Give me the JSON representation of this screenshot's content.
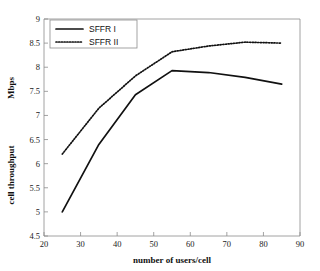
{
  "chart_data": {
    "type": "line",
    "title": "",
    "xlabel": "number of users/cell",
    "ylabel": "cell throughput",
    "yunit": "Mbps",
    "xlim": [
      20,
      90
    ],
    "ylim": [
      4.5,
      9
    ],
    "xticks": [
      "20",
      "30",
      "40",
      "50",
      "60",
      "70",
      "80",
      "90"
    ],
    "yticks": [
      "4.5",
      "5",
      "5.5",
      "6",
      "6.5",
      "7",
      "7.5",
      "8",
      "8.5",
      "9"
    ],
    "xtick_values": [
      20,
      30,
      40,
      50,
      60,
      70,
      80,
      90
    ],
    "ytick_values": [
      4.5,
      5,
      5.5,
      6,
      6.5,
      7,
      7.5,
      8,
      8.5,
      9
    ],
    "grid": false,
    "legend_position": "top-left",
    "x": [
      25,
      35,
      45,
      55,
      65,
      75,
      85
    ],
    "series": [
      {
        "name": "SFFR I",
        "style": "solid",
        "color": "#111111",
        "values": [
          5.0,
          6.4,
          7.43,
          7.93,
          7.89,
          7.79,
          7.65
        ]
      },
      {
        "name": "SFFR II",
        "style": "dotted",
        "color": "#111111",
        "values": [
          6.2,
          7.15,
          7.82,
          8.32,
          8.44,
          8.52,
          8.5
        ]
      }
    ]
  },
  "legend": {
    "entries": [
      {
        "label": "SFFR I",
        "style": "solid"
      },
      {
        "label": "SFFR II",
        "style": "dotted"
      }
    ]
  }
}
